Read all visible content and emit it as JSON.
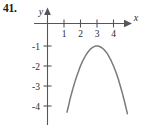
{
  "figure": {
    "problem_number": "41.",
    "axes": {
      "x_label": "x",
      "y_label": "y",
      "x_ticks": [
        "1",
        "2",
        "3",
        "4"
      ],
      "y_ticks": [
        "-1",
        "-2",
        "-3",
        "-4"
      ],
      "x_range": [
        -0.35,
        5.0
      ],
      "y_range": [
        -4.6,
        0.55
      ],
      "grid": false
    },
    "colors": {
      "axis": "#56565a",
      "curve": "#7a7a7e",
      "text": "#2b2b2b",
      "number": "#1a1a1a",
      "background": "#ffffff"
    }
  },
  "chart_data": {
    "type": "line",
    "title": "",
    "subtitle": "",
    "xlabel": "x",
    "ylabel": "y",
    "xlim": [
      -0.35,
      5.0
    ],
    "ylim": [
      -4.6,
      0.55
    ],
    "xticks": [
      1,
      2,
      3,
      4
    ],
    "xticklabels": [
      "1",
      "2",
      "3",
      "4"
    ],
    "yticks": [
      -1,
      -2,
      -3,
      -4
    ],
    "yticklabels": [
      "-1",
      "-2",
      "-3",
      "-4"
    ],
    "grid": false,
    "legend": null,
    "annotations": [],
    "series": [
      {
        "name": "downward parabola, vertex (3, -1)",
        "equation": "y = -(x - 3)^2 - 1",
        "vertex": [
          3,
          -1
        ],
        "opens": "down",
        "x": [
          1.2,
          1.4,
          1.6,
          1.8,
          2.0,
          2.2,
          2.4,
          2.6,
          2.8,
          3.0,
          3.2,
          3.4,
          3.6,
          3.8,
          4.0,
          4.2,
          4.4,
          4.6
        ],
        "y": [
          -4.24,
          -3.56,
          -2.96,
          -2.44,
          -2.0,
          -1.64,
          -1.36,
          -1.16,
          -1.04,
          -1.0,
          -1.04,
          -1.16,
          -1.36,
          -1.64,
          -2.0,
          -2.44,
          -2.96,
          -3.56
        ]
      }
    ]
  }
}
